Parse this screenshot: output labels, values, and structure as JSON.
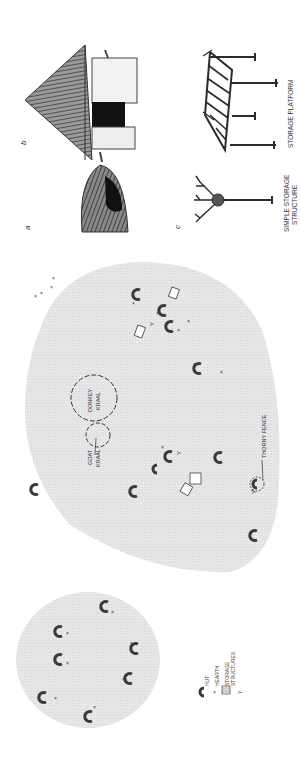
{
  "figure": {
    "orientation": "rotated-90-ccw",
    "panels": {
      "a": {
        "letter": "a",
        "caption": ""
      },
      "b": {
        "letter": "b",
        "caption": ""
      },
      "c": {
        "letter": "c",
        "caption": ""
      }
    },
    "drawing_labels": {
      "simple_storage_line1": "SIMPLE STORAGE",
      "simple_storage_line2": "STRUCTURE",
      "storage_platform": "STORAGE PLATFORM"
    },
    "map_labels": {
      "donkey_line1": "DONKEY",
      "donkey_line2": "KRAAL",
      "goat_line1": "GOAT",
      "goat_line2": "KRAAL",
      "thorny_fence": "THORNY FENCE"
    },
    "legend": {
      "items": [
        {
          "symbol": "hut-icon",
          "label": "HUT"
        },
        {
          "symbol": "hearth-icon",
          "label": "HEARTH"
        },
        {
          "symbol": "storage-structures-icon",
          "label": "STORAGE"
        },
        {
          "symbol": "storage-structures-icon",
          "label": "STRUCTURES"
        },
        {
          "symbol": "y-marker-icon",
          "label": ""
        }
      ]
    },
    "colors": {
      "stipple": "#d6d6d6",
      "ink": "#2b2b2b",
      "hut": "#3a3a3a"
    }
  }
}
